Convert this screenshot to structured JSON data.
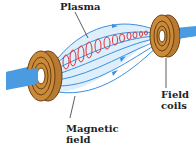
{
  "diagram": {
    "type": "magnetic-confinement",
    "labels": {
      "plasma": "Plasma",
      "field_coils_line1": "Field",
      "field_coils_line2": "coils",
      "magnetic_field_line1": "Magnetic",
      "magnetic_field_line2": "field"
    },
    "colors": {
      "coil": "#c98a3a",
      "coil_dark": "#6b3d10",
      "axis_beam": "#4a9be0",
      "field_line": "#3b8fe0",
      "field_fill": "#d6ebfb",
      "plasma_helix": "#e0343a",
      "label_text": "#222222",
      "leader_line": "#333333"
    }
  }
}
